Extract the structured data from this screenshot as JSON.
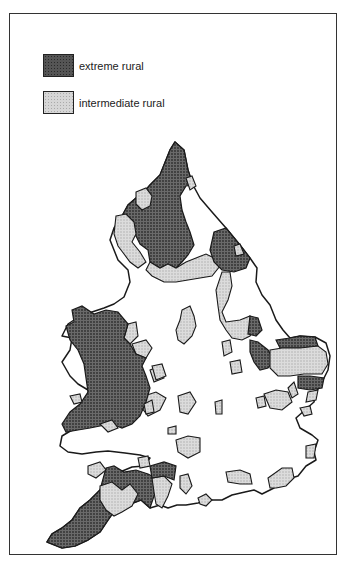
{
  "figure": {
    "type": "thematic map",
    "region": "England and Wales"
  },
  "legend": {
    "items": [
      {
        "label": "extreme rural",
        "pattern": "dark-stipple",
        "color": "#555555"
      },
      {
        "label": "intermediate rural",
        "pattern": "light-stipple",
        "color": "#d6d6d6"
      }
    ]
  },
  "colors": {
    "extreme": "#575757",
    "intermediate": "#d4d4d4",
    "land": "#ffffff",
    "outline": "#1a1a1a"
  }
}
